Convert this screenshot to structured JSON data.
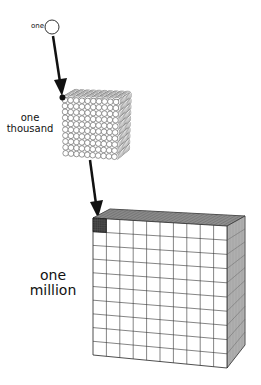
{
  "diagram": {
    "stages": [
      {
        "id": "one",
        "label": "one",
        "shape": "single-sphere"
      },
      {
        "id": "thousand",
        "label_lines": [
          "one",
          "thousand"
        ],
        "shape": "cube-of-spheres",
        "grid": 10
      },
      {
        "id": "million",
        "label_lines": [
          "one",
          "million"
        ],
        "shape": "cube-of-cubes",
        "grid": 10,
        "highlighted_corner_block": true
      }
    ],
    "arrows": [
      {
        "from": "one",
        "to": "thousand"
      },
      {
        "from": "thousand",
        "to": "million"
      }
    ]
  },
  "labels": {
    "one": "one",
    "thousand_line1": "one",
    "thousand_line2": "thousand",
    "million_line1": "one",
    "million_line2": "million"
  },
  "colors": {
    "stroke": "#222222",
    "highlight": "#444444",
    "background": "#ffffff"
  }
}
